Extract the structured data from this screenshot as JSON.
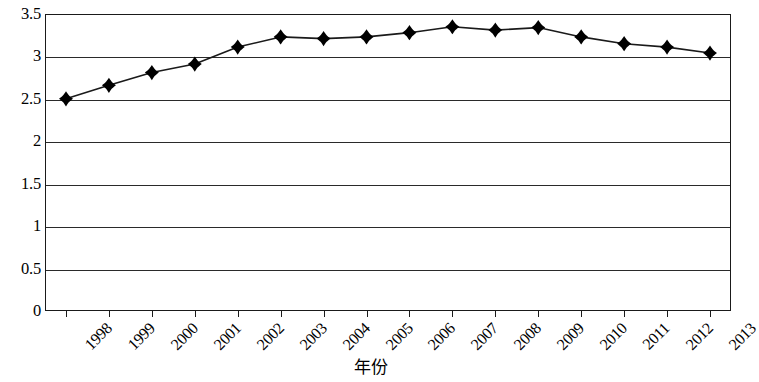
{
  "chart_data": {
    "type": "line",
    "title": "",
    "xlabel": "年份",
    "ylabel": "",
    "grid": true,
    "legend": "none",
    "marker": "diamond",
    "line_color": "#1a1a1a",
    "marker_color": "#000000",
    "xlim": [
      1998,
      2013
    ],
    "ylim": [
      0,
      3.5
    ],
    "yticks": [
      "0",
      "0.5",
      "1",
      "1.5",
      "2",
      "2.5",
      "3",
      "3.5"
    ],
    "ytick_values": [
      0,
      0.5,
      1,
      1.5,
      2,
      2.5,
      3,
      3.5
    ],
    "categories": [
      "1998",
      "1999",
      "2000",
      "2001",
      "2002",
      "2003",
      "2004",
      "2005",
      "2006",
      "2007",
      "2008",
      "2009",
      "2010",
      "2011",
      "2012",
      "2013"
    ],
    "values": [
      2.5,
      2.66,
      2.81,
      2.91,
      3.11,
      3.23,
      3.21,
      3.23,
      3.28,
      3.35,
      3.31,
      3.34,
      3.23,
      3.15,
      3.11,
      3.04
    ],
    "series": [
      {
        "name": "",
        "values": [
          2.5,
          2.66,
          2.81,
          2.91,
          3.11,
          3.23,
          3.21,
          3.23,
          3.28,
          3.35,
          3.31,
          3.34,
          3.23,
          3.15,
          3.11,
          3.04
        ]
      }
    ]
  }
}
